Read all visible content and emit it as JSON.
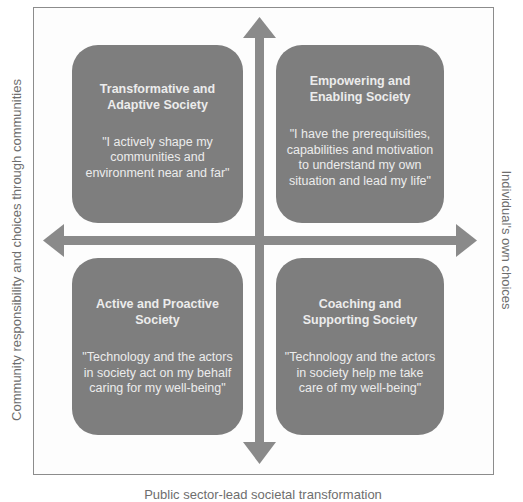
{
  "diagram": {
    "quadrants": {
      "top_left": {
        "title_line1": "Transformative and",
        "title_line2": "Adaptive Society",
        "quote_lines": [
          "\"I actively shape my",
          "communities and",
          "environment near and far\""
        ]
      },
      "top_right": {
        "title_line1": "Empowering and",
        "title_line2": "Enabling Society",
        "quote_lines": [
          "\"I have the prerequisities,",
          "capabilities and motivation",
          "to understand my own",
          "situation and lead my life\""
        ]
      },
      "bottom_left": {
        "title_line1": "Active and Proactive",
        "title_line2": "Society",
        "quote_lines": [
          "\"Technology and the actors",
          "in society act on my behalf",
          "caring for my well-being\""
        ]
      },
      "bottom_right": {
        "title_line1": "Coaching and",
        "title_line2": "Supporting Society",
        "quote_lines": [
          "\"Technology and the actors",
          "in society help me take",
          "care of my well-being\""
        ]
      }
    },
    "axes": {
      "left_label": "Community responsibility and choices through communities",
      "right_label": "Individual's own choices",
      "bottom_label": "Public sector-lead societal transformation"
    },
    "colors": {
      "box_fill": "#7e7e7e",
      "box_text": "#ececec",
      "arrow_fill": "#8a8a8a",
      "label_text": "#6e6e6e"
    }
  }
}
